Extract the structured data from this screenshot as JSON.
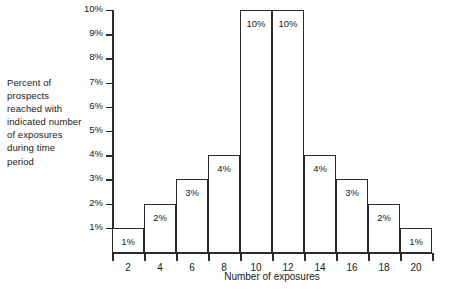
{
  "caption": {
    "lines": [
      "Percent of",
      "prospects",
      "reached with",
      "indicated number",
      "of exposures",
      "during time",
      "period"
    ]
  },
  "chart_data": {
    "type": "bar",
    "title": "",
    "xlabel": "Number of exposures",
    "ylabel": "",
    "categories": [
      "2",
      "4",
      "6",
      "8",
      "10",
      "12",
      "14",
      "16",
      "18",
      "20"
    ],
    "values": [
      1,
      2,
      3,
      4,
      10,
      10,
      4,
      3,
      2,
      1
    ],
    "bar_labels": [
      "1%",
      "2%",
      "3%",
      "4%",
      "10%",
      "10%",
      "4%",
      "3%",
      "2%",
      "1%"
    ],
    "ylim": [
      0,
      10
    ],
    "ytick_values": [
      10,
      9,
      8,
      7,
      6,
      5,
      4,
      3,
      2,
      1
    ],
    "ytick_labels": [
      "10%",
      "9%",
      "8%",
      "7%",
      "6%",
      "5%",
      "4%",
      "3%",
      "2%",
      "1%"
    ],
    "grid": false,
    "legend": null,
    "colors": {
      "line": "#2b2b2b",
      "fill": "#ffffff",
      "text": "#1b1b1b",
      "background": "#fdfdfd"
    }
  }
}
